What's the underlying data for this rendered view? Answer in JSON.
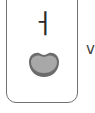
{
  "card": {
    "letter": "ㅓ",
    "mouth_icon": "mouth-open-icon",
    "colors": {
      "border": "#707070",
      "letter": "#2a2a2a",
      "mouth_outline": "#6b6b6b",
      "mouth_fill": "#a8a8a8"
    }
  },
  "side_label": "v"
}
